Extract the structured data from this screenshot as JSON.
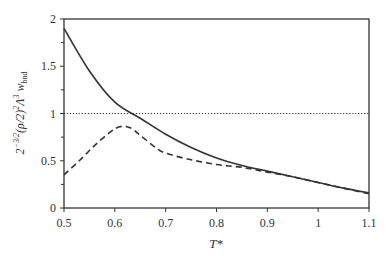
{
  "chart_data": {
    "type": "line",
    "title": "",
    "xlabel": "T*",
    "ylabel": "2^{-3/2}(ρ/2)^2 Λ^3 w_bnd",
    "xlim": [
      0.5,
      1.1
    ],
    "ylim": [
      0,
      2
    ],
    "xticks": [
      "0.5",
      "0.6",
      "0.7",
      "0.8",
      "0.9",
      "1",
      "1.1"
    ],
    "yticks": [
      "0",
      "0.5",
      "1",
      "1.5",
      "2"
    ],
    "grid": false,
    "legend": null,
    "series": [
      {
        "name": "solid",
        "style": "solid",
        "x": [
          0.5,
          0.55,
          0.6,
          0.65,
          0.7,
          0.75,
          0.8,
          0.85,
          0.9,
          0.95,
          1.0,
          1.05,
          1.1
        ],
        "y": [
          1.9,
          1.45,
          1.12,
          0.95,
          0.78,
          0.64,
          0.53,
          0.45,
          0.39,
          0.33,
          0.27,
          0.21,
          0.16
        ]
      },
      {
        "name": "dashed",
        "style": "dashed",
        "x": [
          0.5,
          0.53,
          0.56,
          0.59,
          0.61,
          0.63,
          0.65,
          0.68,
          0.7,
          0.75,
          0.8,
          0.85,
          0.9,
          0.95,
          1.0,
          1.05,
          1.1
        ],
        "y": [
          0.35,
          0.5,
          0.66,
          0.8,
          0.86,
          0.85,
          0.77,
          0.64,
          0.58,
          0.51,
          0.46,
          0.43,
          0.38,
          0.33,
          0.27,
          0.21,
          0.15
        ]
      },
      {
        "name": "reference",
        "style": "dotted",
        "x": [
          0.5,
          1.1
        ],
        "y": [
          1.0,
          1.0
        ]
      }
    ]
  }
}
